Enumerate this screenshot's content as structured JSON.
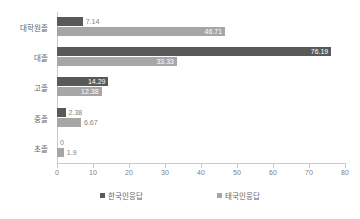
{
  "chart_data": {
    "type": "bar",
    "orientation": "horizontal",
    "title": "",
    "xlabel": "",
    "ylabel": "",
    "xlim": [
      0,
      80
    ],
    "xticks": [
      0,
      10,
      20,
      30,
      40,
      50,
      60,
      70,
      80
    ],
    "grid": false,
    "legend_position": "bottom",
    "categories": [
      "대학원졸",
      "대졸",
      "고졸",
      "중졸",
      "초졸"
    ],
    "series": [
      {
        "name": "한국인응답",
        "color": "#595959",
        "values": [
          7.14,
          76.19,
          14.29,
          2.38,
          0
        ]
      },
      {
        "name": "태국인응답",
        "color": "#a6a6a6",
        "values": [
          46.71,
          33.33,
          12.38,
          6.67,
          1.9
        ]
      }
    ],
    "value_labels": {
      "한국인응답": [
        "7.14",
        "76.19",
        "14.29",
        "2.38",
        "0"
      ],
      "태국인응답": [
        "46.71",
        "33.33",
        "12.38",
        "6.67",
        "1.9"
      ]
    }
  },
  "legend": {
    "items": [
      {
        "label": "한국인응답",
        "color": "#595959"
      },
      {
        "label": "태국인응답",
        "color": "#a6a6a6"
      }
    ]
  },
  "axis": {
    "x_tick_labels": [
      "0",
      "10",
      "20",
      "30",
      "40",
      "50",
      "60",
      "70",
      "80"
    ]
  }
}
